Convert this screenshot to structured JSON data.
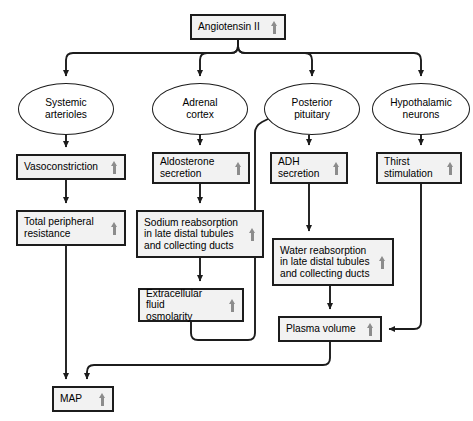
{
  "diagram": {
    "style": {
      "stroke": "#1c1c1c",
      "box_fill": "#f2f2f2",
      "ellipse_fill": "#ffffff",
      "arrow_glyph_color": "#8c8c8c",
      "background": "#ffffff"
    },
    "up_arrow_symbol": "increase-arrow",
    "nodes": [
      {
        "id": "angiotensin",
        "shape": "box",
        "label": "Angiotensin II",
        "arrow": true,
        "x": 190,
        "y": 14,
        "w": 96,
        "h": 26
      },
      {
        "id": "systemic_arterioles",
        "shape": "ellipse",
        "label": "Systemic\narterioles",
        "arrow": false,
        "x": 18,
        "y": 83,
        "w": 96,
        "h": 52
      },
      {
        "id": "adrenal_cortex",
        "shape": "ellipse",
        "label": "Adrenal\ncortex",
        "arrow": false,
        "x": 152,
        "y": 83,
        "w": 96,
        "h": 52
      },
      {
        "id": "posterior_pituitary",
        "shape": "ellipse",
        "label": "Posterior\npituitary",
        "arrow": false,
        "x": 264,
        "y": 83,
        "w": 96,
        "h": 52
      },
      {
        "id": "hypothalamic_neurons",
        "shape": "ellipse",
        "label": "Hypothalamic\nneurons",
        "arrow": false,
        "x": 372,
        "y": 83,
        "w": 98,
        "h": 52
      },
      {
        "id": "vasoconstriction",
        "shape": "box",
        "label": "Vasoconstriction",
        "arrow": true,
        "x": 16,
        "y": 154,
        "w": 110,
        "h": 26
      },
      {
        "id": "aldosterone",
        "shape": "box",
        "label": "Aldosterone\nsecretion",
        "arrow": true,
        "x": 152,
        "y": 152,
        "w": 98,
        "h": 32
      },
      {
        "id": "adh",
        "shape": "box",
        "label": "ADH\nsecretion",
        "arrow": true,
        "x": 270,
        "y": 152,
        "w": 78,
        "h": 32
      },
      {
        "id": "thirst",
        "shape": "box",
        "label": "Thirst\nstimulation",
        "arrow": true,
        "x": 376,
        "y": 152,
        "w": 86,
        "h": 32
      },
      {
        "id": "tpr",
        "shape": "box",
        "label": "Total peripheral\nresistance",
        "arrow": true,
        "x": 16,
        "y": 210,
        "w": 110,
        "h": 36
      },
      {
        "id": "sodium_reabsorption",
        "shape": "box",
        "label": "Sodium reabsorption\nin late distal tubules\nand collecting ducts",
        "arrow": true,
        "x": 136,
        "y": 210,
        "w": 128,
        "h": 48
      },
      {
        "id": "water_reabsorption",
        "shape": "box",
        "label": "Water reabsorption\nin late distal tubules\nand collecting ducts",
        "arrow": true,
        "x": 272,
        "y": 238,
        "w": 122,
        "h": 48
      },
      {
        "id": "ecf_osmolarity",
        "shape": "box",
        "label": "Extracellular fluid\nosmolarity",
        "arrow": true,
        "x": 138,
        "y": 288,
        "w": 106,
        "h": 34
      },
      {
        "id": "plasma_volume",
        "shape": "box",
        "label": "Plasma volume",
        "arrow": true,
        "x": 278,
        "y": 316,
        "w": 104,
        "h": 26
      },
      {
        "id": "map",
        "shape": "box",
        "label": "MAP",
        "arrow": true,
        "x": 52,
        "y": 386,
        "w": 62,
        "h": 26
      }
    ],
    "edges": [
      {
        "from": "angiotensin",
        "to": "systemic_arterioles"
      },
      {
        "from": "angiotensin",
        "to": "adrenal_cortex"
      },
      {
        "from": "angiotensin",
        "to": "posterior_pituitary"
      },
      {
        "from": "angiotensin",
        "to": "hypothalamic_neurons"
      },
      {
        "from": "systemic_arterioles",
        "to": "vasoconstriction"
      },
      {
        "from": "adrenal_cortex",
        "to": "aldosterone"
      },
      {
        "from": "posterior_pituitary",
        "to": "adh"
      },
      {
        "from": "hypothalamic_neurons",
        "to": "thirst"
      },
      {
        "from": "vasoconstriction",
        "to": "tpr"
      },
      {
        "from": "aldosterone",
        "to": "sodium_reabsorption"
      },
      {
        "from": "adh",
        "to": "water_reabsorption"
      },
      {
        "from": "sodium_reabsorption",
        "to": "ecf_osmolarity"
      },
      {
        "from": "ecf_osmolarity",
        "to": "posterior_pituitary"
      },
      {
        "from": "water_reabsorption",
        "to": "plasma_volume"
      },
      {
        "from": "thirst",
        "to": "plasma_volume"
      },
      {
        "from": "tpr",
        "to": "map"
      },
      {
        "from": "plasma_volume",
        "to": "map"
      }
    ]
  }
}
